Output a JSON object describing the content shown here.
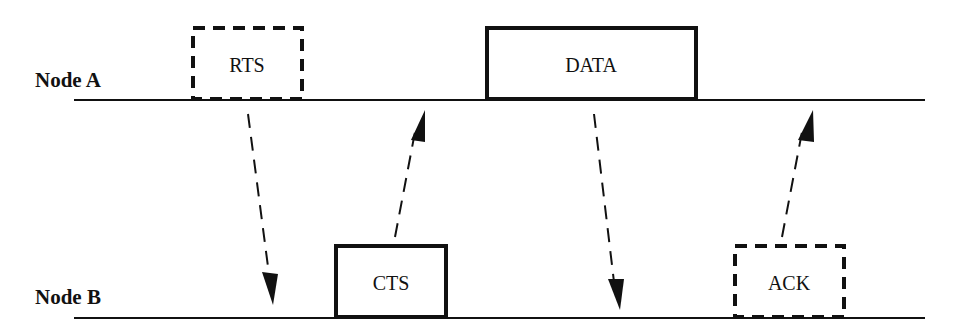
{
  "diagram": {
    "type": "sequence-timing",
    "nodes": [
      {
        "id": "A",
        "label": "Node A"
      },
      {
        "id": "B",
        "label": "Node B"
      }
    ],
    "frames": [
      {
        "label": "RTS",
        "node": "A",
        "style": "dashed"
      },
      {
        "label": "CTS",
        "node": "B",
        "style": "solid"
      },
      {
        "label": "DATA",
        "node": "A",
        "style": "solid"
      },
      {
        "label": "ACK",
        "node": "B",
        "style": "dashed"
      }
    ],
    "arrows": [
      {
        "from": "A",
        "to": "B",
        "after": "RTS",
        "style": "dashed"
      },
      {
        "from": "B",
        "to": "A",
        "after": "CTS",
        "style": "dashed"
      },
      {
        "from": "A",
        "to": "B",
        "after": "DATA",
        "style": "dashed"
      },
      {
        "from": "B",
        "to": "A",
        "after": "ACK",
        "style": "dashed"
      }
    ],
    "colors": {
      "stroke": "#111111",
      "background": "#ffffff"
    }
  }
}
